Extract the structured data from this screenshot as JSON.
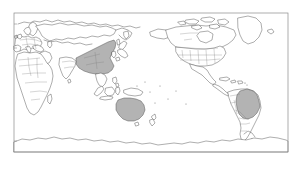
{
  "figure": {
    "type": "world-map",
    "projection": "equirectangular-pacific-centered",
    "background_color": "#ffffff",
    "ocean_color": "#ffffff",
    "land_fill_color": "#ffffff",
    "coastline_color": "#4a4a4a",
    "border_color": "#7d7d7d",
    "highlight_color": "#b3b3b3",
    "frame_color": "#8a8a8a",
    "title": "",
    "caption": "",
    "legend": []
  },
  "frame": {
    "x": 14,
    "y": 13,
    "width": 274,
    "height": 139
  },
  "highlighted_regions": [
    {
      "name": "China",
      "continent": "Asia",
      "fill": "#b3b3b3"
    },
    {
      "name": "Australia",
      "continent": "Oceania",
      "fill": "#b3b3b3"
    },
    {
      "name": "Brazil",
      "continent": "South America",
      "fill": "#b3b3b3"
    }
  ],
  "unhighlighted_regions": [
    {
      "name": "Africa"
    },
    {
      "name": "Europe"
    },
    {
      "name": "North America"
    },
    {
      "name": "Greenland"
    },
    {
      "name": "Russia"
    },
    {
      "name": "India"
    },
    {
      "name": "Antarctica"
    },
    {
      "name": "Southeast Asia"
    }
  ],
  "labels": {
    "axis_x": "",
    "axis_y": "",
    "tick_labels": []
  }
}
